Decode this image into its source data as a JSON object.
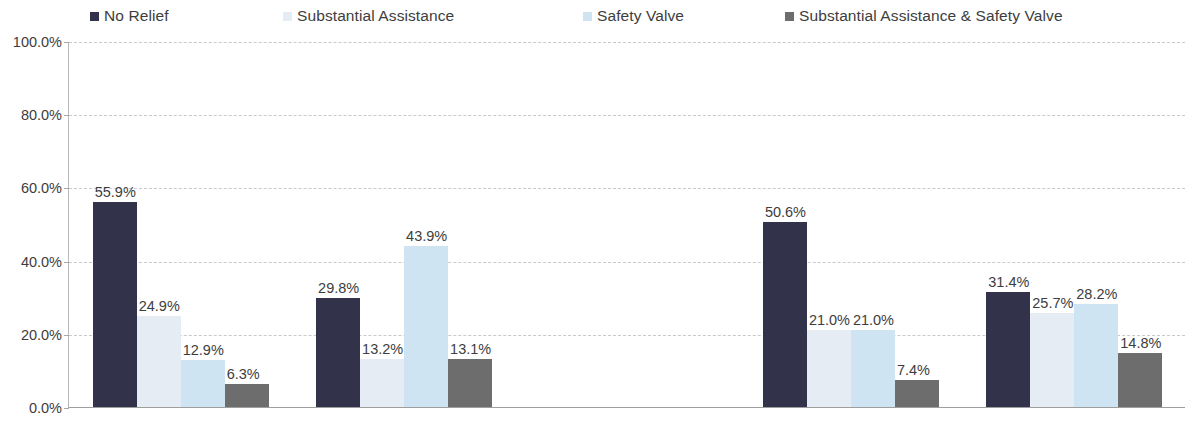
{
  "chart_data": {
    "type": "bar",
    "title": "",
    "xlabel": "",
    "ylabel": "",
    "ylim": [
      0,
      100
    ],
    "grid": true,
    "legend_position": "top",
    "y_ticks": [
      "0.0%",
      "20.0%",
      "40.0%",
      "60.0%",
      "80.0%",
      "100.0%"
    ],
    "y_tick_values": [
      0,
      20,
      40,
      60,
      80,
      100
    ],
    "categories": [
      "U.S. Citizen",
      "Non-U.S. Citizen",
      "",
      "Male",
      "Female"
    ],
    "series": [
      {
        "name": "No Relief",
        "color": "#32324a",
        "values": [
          55.9,
          29.8,
          null,
          50.6,
          31.4
        ],
        "labels": [
          "55.9%",
          "29.8%",
          "",
          "50.6%",
          "31.4%"
        ]
      },
      {
        "name": "Substantial Assistance",
        "color": "#e5ecf4",
        "values": [
          24.9,
          13.2,
          null,
          21.0,
          25.7
        ],
        "labels": [
          "24.9%",
          "13.2%",
          "",
          "21.0%",
          "25.7%"
        ]
      },
      {
        "name": "Safety Valve",
        "color": "#cfe4f2",
        "values": [
          12.9,
          43.9,
          null,
          21.0,
          28.2
        ],
        "labels": [
          "12.9%",
          "43.9%",
          "",
          "21.0%",
          "28.2%"
        ]
      },
      {
        "name": "Substantial Assistance & Safety Valve",
        "color": "#6d6d6d",
        "values": [
          6.3,
          13.1,
          null,
          7.4,
          14.8
        ],
        "labels": [
          "6.3%",
          "13.1%",
          "",
          "7.4%",
          "14.8%"
        ]
      }
    ]
  },
  "legend": {
    "items": [
      {
        "label": "No Relief",
        "color": "#32324a"
      },
      {
        "label": "Substantial Assistance",
        "color": "#e5ecf4"
      },
      {
        "label": "Safety Valve",
        "color": "#cfe4f2"
      },
      {
        "label": "Substantial Assistance & Safety Valve",
        "color": "#6d6d6d"
      }
    ]
  },
  "axis": {
    "y_labels": [
      "100.0%",
      "80.0%",
      "60.0%",
      "40.0%",
      "20.0%",
      "0.0%"
    ]
  },
  "categories": [
    {
      "label": "U.S. Citizen"
    },
    {
      "label": "Non-U.S. Citizen"
    },
    {
      "label": ""
    },
    {
      "label": "Male"
    },
    {
      "label": "Female"
    }
  ]
}
